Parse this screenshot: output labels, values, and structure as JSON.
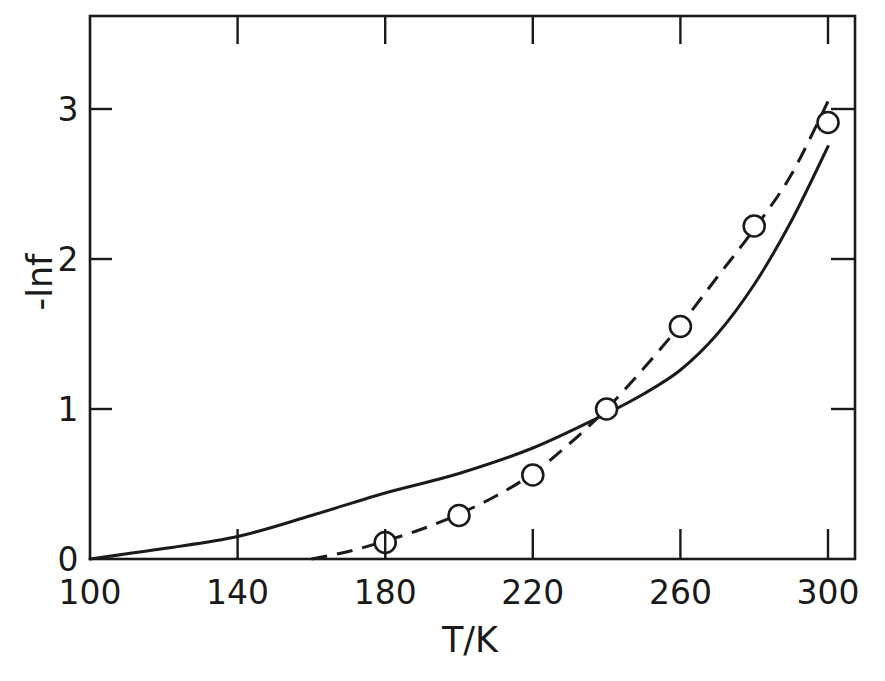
{
  "chart_data": {
    "type": "line",
    "title": "",
    "xlabel": "T/K",
    "ylabel": "-lnf",
    "xlim": [
      100,
      305
    ],
    "ylim": [
      0,
      3.0
    ],
    "x_ticks": [
      100,
      140,
      180,
      220,
      260,
      300
    ],
    "x_tick_labels": [
      "100",
      "140",
      "180",
      "220",
      "260",
      "300"
    ],
    "y_ticks": [
      0,
      1,
      2,
      3
    ],
    "y_tick_labels": [
      "0",
      "1",
      "2",
      "3"
    ],
    "grid": false,
    "legend": null,
    "series": [
      {
        "name": "calculated (solid line)",
        "style": "solid",
        "marker": "none",
        "x": [
          100,
          120,
          140,
          160,
          180,
          200,
          220,
          240,
          250,
          260,
          270,
          280,
          290,
          300
        ],
        "y": [
          0.0,
          0.07,
          0.15,
          0.29,
          0.44,
          0.57,
          0.74,
          0.97,
          1.1,
          1.26,
          1.5,
          1.83,
          2.25,
          2.75
        ]
      },
      {
        "name": "experimental (dashed line, open circles)",
        "style": "dashed",
        "marker": "open-circle",
        "x": [
          180,
          200,
          220,
          240,
          260,
          280,
          300
        ],
        "y": [
          0.11,
          0.29,
          0.56,
          1.0,
          1.55,
          2.22,
          2.91
        ],
        "fit_line": {
          "x": [
            160,
            170,
            180,
            190,
            200,
            210,
            220,
            230,
            240,
            250,
            260,
            270,
            280,
            290,
            300
          ],
          "y": [
            0.0,
            0.05,
            0.12,
            0.2,
            0.3,
            0.42,
            0.57,
            0.77,
            1.0,
            1.27,
            1.56,
            1.88,
            2.2,
            2.56,
            3.05
          ]
        }
      }
    ]
  },
  "labels": {
    "xlabel": "T/K",
    "ylabel": "-lnf",
    "x_ticks": [
      "100",
      "140",
      "180",
      "220",
      "260",
      "300"
    ],
    "y_ticks": [
      "0",
      "1",
      "2",
      "3"
    ]
  }
}
